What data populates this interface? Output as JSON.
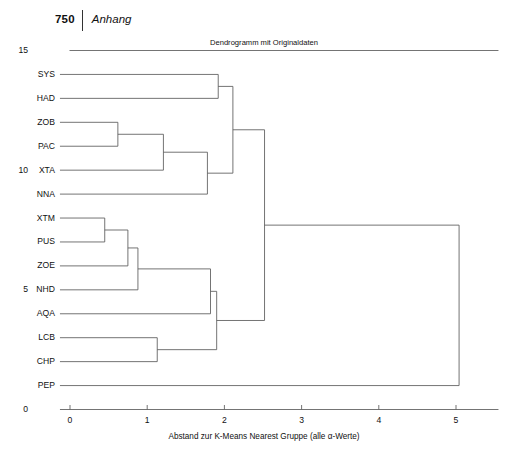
{
  "running_head": {
    "page_number": "750",
    "section": "Anhang"
  },
  "figure": {
    "title": "Dendrogramm mit Originaldaten",
    "xlabel": "Abstand zur K-Means Nearest Gruppe (alle α-Werte)"
  },
  "chart_data": {
    "type": "dendrogram",
    "title": "Dendrogramm mit Originaldaten",
    "xlabel": "Abstand zur K-Means Nearest Gruppe (alle α-Werte)",
    "ylabel": "",
    "xlim": [
      -0.15,
      5.6
    ],
    "ylim": [
      0,
      15
    ],
    "x_ticks": [
      "0",
      "1",
      "2",
      "3",
      "4",
      "5"
    ],
    "x_tick_values": [
      0,
      1,
      2,
      3,
      4,
      5
    ],
    "y_ticks": [
      "0",
      "5",
      "10",
      "15"
    ],
    "y_tick_values": [
      0,
      5,
      10,
      15
    ],
    "grid": false,
    "legend": "none",
    "leaves": [
      {
        "label": "SYS",
        "y": 14
      },
      {
        "label": "HAD",
        "y": 13
      },
      {
        "label": "ZOB",
        "y": 12
      },
      {
        "label": "PAC",
        "y": 11
      },
      {
        "label": "XTA",
        "y": 10
      },
      {
        "label": "NNA",
        "y": 9
      },
      {
        "label": "XTM",
        "y": 8
      },
      {
        "label": "PUS",
        "y": 7
      },
      {
        "label": "ZOE",
        "y": 6
      },
      {
        "label": "NHD",
        "y": 5
      },
      {
        "label": "AQA",
        "y": 4
      },
      {
        "label": "LCB",
        "y": 3
      },
      {
        "label": "CHP",
        "y": 2
      },
      {
        "label": "PEP",
        "y": 1
      }
    ],
    "merges": [
      {
        "id": "m1",
        "children": [
          "XTM",
          "PUS"
        ],
        "distance": 0.45
      },
      {
        "id": "m2",
        "children": [
          "ZOB",
          "PAC"
        ],
        "distance": 0.62
      },
      {
        "id": "m3",
        "children": [
          "m1",
          "ZOE"
        ],
        "distance": 0.75
      },
      {
        "id": "m4",
        "children": [
          "m3",
          "NHD"
        ],
        "distance": 0.88
      },
      {
        "id": "m5",
        "children": [
          "LCB",
          "CHP"
        ],
        "distance": 1.13
      },
      {
        "id": "m6",
        "children": [
          "m2",
          "XTA"
        ],
        "distance": 1.21
      },
      {
        "id": "m7",
        "children": [
          "m6",
          "NNA"
        ],
        "distance": 1.78
      },
      {
        "id": "m8",
        "children": [
          "m4",
          "AQA"
        ],
        "distance": 1.82
      },
      {
        "id": "m9",
        "children": [
          "m8",
          "m5"
        ],
        "distance": 1.9
      },
      {
        "id": "m10",
        "children": [
          "SYS",
          "HAD"
        ],
        "distance": 1.92
      },
      {
        "id": "m11",
        "children": [
          "m10",
          "m7"
        ],
        "distance": 2.11
      },
      {
        "id": "m12",
        "children": [
          "m11",
          "m9"
        ],
        "distance": 2.52
      },
      {
        "id": "m13",
        "children": [
          "m12",
          "PEP"
        ],
        "distance": 5.04
      }
    ]
  }
}
